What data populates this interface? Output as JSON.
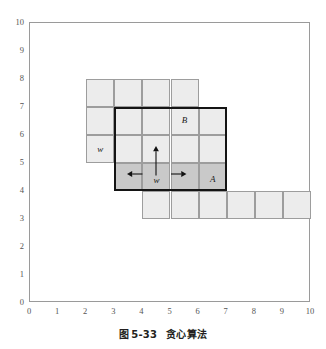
{
  "caption": {
    "prefix": "图",
    "number": "5-33",
    "title": "贪心算法",
    "full": "图 5-33  贪心算法"
  },
  "colors": {
    "cell_fill": "#ececec",
    "cell_fill_dark": "#c9c9c9",
    "cell_stroke": "#9d9d9d",
    "heavy_stroke": "#141414",
    "axis": "#9a9a9a",
    "tick_text": "#555555",
    "label_text": "#1a1a1a"
  },
  "chart_data": {
    "type": "diagram",
    "xlabel": "",
    "ylabel": "",
    "xlim": [
      0,
      10
    ],
    "ylim": [
      0,
      10
    ],
    "grid": false,
    "xticks": [
      "0",
      "1",
      "2",
      "3",
      "4",
      "5",
      "6",
      "7",
      "8",
      "9",
      "10"
    ],
    "yticks": [
      "0",
      "1",
      "2",
      "3",
      "4",
      "5",
      "6",
      "7",
      "8",
      "9",
      "10"
    ],
    "legend": [],
    "cells": [
      {
        "x": 2,
        "y": 7,
        "w": 1,
        "h": 1,
        "shade": "light"
      },
      {
        "x": 3,
        "y": 7,
        "w": 1,
        "h": 1,
        "shade": "light"
      },
      {
        "x": 4,
        "y": 7,
        "w": 1,
        "h": 1,
        "shade": "light"
      },
      {
        "x": 5,
        "y": 7,
        "w": 1,
        "h": 1,
        "shade": "light"
      },
      {
        "x": 2,
        "y": 6,
        "w": 1,
        "h": 1,
        "shade": "light"
      },
      {
        "x": 3,
        "y": 6,
        "w": 1,
        "h": 1,
        "shade": "light"
      },
      {
        "x": 4,
        "y": 6,
        "w": 1,
        "h": 1,
        "shade": "light"
      },
      {
        "x": 5,
        "y": 6,
        "w": 1,
        "h": 1,
        "shade": "light"
      },
      {
        "x": 6,
        "y": 6,
        "w": 1,
        "h": 1,
        "shade": "light"
      },
      {
        "x": 2,
        "y": 5,
        "w": 1,
        "h": 1,
        "shade": "light"
      },
      {
        "x": 3,
        "y": 5,
        "w": 1,
        "h": 1,
        "shade": "light"
      },
      {
        "x": 4,
        "y": 5,
        "w": 1,
        "h": 1,
        "shade": "light"
      },
      {
        "x": 5,
        "y": 5,
        "w": 1,
        "h": 1,
        "shade": "light"
      },
      {
        "x": 6,
        "y": 5,
        "w": 1,
        "h": 1,
        "shade": "light"
      },
      {
        "x": 3,
        "y": 4,
        "w": 1,
        "h": 1,
        "shade": "dark"
      },
      {
        "x": 4,
        "y": 4,
        "w": 1,
        "h": 1,
        "shade": "dark"
      },
      {
        "x": 5,
        "y": 4,
        "w": 1,
        "h": 1,
        "shade": "dark"
      },
      {
        "x": 6,
        "y": 4,
        "w": 1,
        "h": 1,
        "shade": "dark"
      },
      {
        "x": 4,
        "y": 3,
        "w": 1,
        "h": 1,
        "shade": "light"
      },
      {
        "x": 5,
        "y": 3,
        "w": 1,
        "h": 1,
        "shade": "light"
      },
      {
        "x": 6,
        "y": 3,
        "w": 1,
        "h": 1,
        "shade": "light"
      },
      {
        "x": 7,
        "y": 3,
        "w": 1,
        "h": 1,
        "shade": "light"
      },
      {
        "x": 8,
        "y": 3,
        "w": 1,
        "h": 1,
        "shade": "light"
      },
      {
        "x": 9,
        "y": 3,
        "w": 1,
        "h": 1,
        "shade": "light"
      }
    ],
    "heavy_box": {
      "x": 3,
      "y": 4,
      "w": 4,
      "h": 3
    },
    "annotations": [
      {
        "text": "B",
        "x": 5.5,
        "y": 6.55,
        "style": "italic"
      },
      {
        "text": "w",
        "x": 2.5,
        "y": 5.5,
        "style": "italic"
      },
      {
        "text": "w",
        "x": 4.5,
        "y": 4.38,
        "style": "italic"
      },
      {
        "text": "A",
        "x": 6.5,
        "y": 4.42,
        "style": "italic"
      }
    ],
    "arrows": [
      {
        "name": "arrow-up",
        "from": [
          4.5,
          4.55
        ],
        "to": [
          4.5,
          5.6
        ],
        "direction": "up"
      },
      {
        "name": "arrow-left",
        "from": [
          4.0,
          4.62
        ],
        "to": [
          3.45,
          4.62
        ],
        "direction": "left"
      },
      {
        "name": "arrow-right",
        "from": [
          5.0,
          4.62
        ],
        "to": [
          5.55,
          4.62
        ],
        "direction": "right"
      }
    ]
  }
}
